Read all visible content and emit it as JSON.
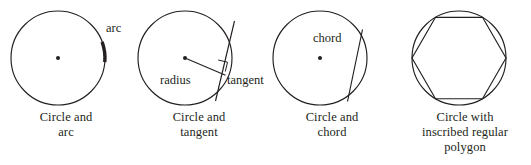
{
  "figure": {
    "background_color": "#ffffff",
    "ink_color": "#231f20",
    "panel_count": 4
  },
  "panels": [
    {
      "id": "circle-and-arc",
      "caption_line1": "Circle and",
      "caption_line2": "arc",
      "labels": {
        "arc": "arc"
      },
      "geometry": {
        "circle": {
          "cx": 58,
          "cy": 58,
          "r": 47
        },
        "center_dot": {
          "cx": 58,
          "cy": 58,
          "r": 2
        },
        "arc_start_angle_deg": -62,
        "arc_end_angle_deg": 5,
        "arc_stroke_width": 3.4
      }
    },
    {
      "id": "circle-and-tangent",
      "caption_line1": "Circle and",
      "caption_line2": "tangent",
      "labels": {
        "radius": "radius",
        "tangent": "tangent"
      },
      "geometry": {
        "circle": {
          "cx": 52,
          "cy": 58,
          "r": 47
        },
        "center_dot": {
          "cx": 52,
          "cy": 58,
          "r": 2
        },
        "radius_from": {
          "x": 52,
          "y": 58
        },
        "radius_to": {
          "x": 92,
          "y": 75
        },
        "tangent_from": {
          "x": 101,
          "y": 22
        },
        "tangent_to": {
          "x": 83,
          "y": 100
        },
        "right_angle_marker": true
      }
    },
    {
      "id": "circle-and-chord",
      "caption_line1": "Circle and",
      "caption_line2": "chord",
      "labels": {
        "chord": "chord"
      },
      "geometry": {
        "circle": {
          "cx": 54,
          "cy": 58,
          "r": 47
        },
        "center_dot": {
          "cx": 54,
          "cy": 58,
          "r": 2
        },
        "chord_from": {
          "x": 96,
          "y": 30
        },
        "chord_to": {
          "x": 81,
          "y": 102
        }
      }
    },
    {
      "id": "circle-with-inscribed-regular-polygon",
      "caption_line1": "Circle with",
      "caption_line2": "inscribed regular",
      "caption_line3": "polygon",
      "labels": {},
      "geometry": {
        "circle": {
          "cx": 60,
          "cy": 58,
          "r": 47
        },
        "polygon_sides": 6,
        "polygon_rotation_deg": 0,
        "polygon_points": "107,58 83.5,98.7 36.5,98.7 13,58 36.5,17.3 83.5,17.3"
      }
    }
  ]
}
